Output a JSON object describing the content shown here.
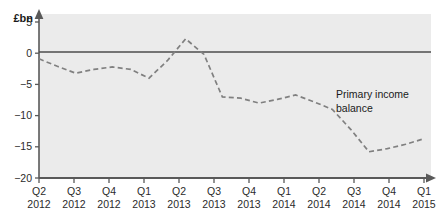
{
  "chart_data": {
    "type": "line",
    "title": "",
    "subtitle": "",
    "unit_label": "£bn",
    "xlabel": "",
    "ylabel": "",
    "ylim": [
      -20,
      5
    ],
    "yticks": [
      5,
      0,
      -5,
      -10,
      -15,
      -20
    ],
    "ytick_labels": [
      "5",
      "0",
      "−5",
      "−10",
      "−15",
      "−20"
    ],
    "grid": false,
    "zero_line": true,
    "legend_position": "inline-annotation",
    "categories": [
      "Q2 2012",
      "Q3 2012",
      "Q4 2012",
      "Q1 2013",
      "Q2 2013",
      "Q3 2013",
      "Q4 2013",
      "Q1 2014",
      "Q2 2014",
      "Q3 2014",
      "Q4 2014",
      "Q1 2015"
    ],
    "xtick_labels": [
      {
        "quarter": "Q2",
        "year": "2012"
      },
      {
        "quarter": "Q3",
        "year": "2012"
      },
      {
        "quarter": "Q4",
        "year": "2012"
      },
      {
        "quarter": "Q1",
        "year": "2013"
      },
      {
        "quarter": "Q2",
        "year": "2013"
      },
      {
        "quarter": "Q3",
        "year": "2013"
      },
      {
        "quarter": "Q4",
        "year": "2013"
      },
      {
        "quarter": "Q1",
        "year": "2014"
      },
      {
        "quarter": "Q2",
        "year": "2014"
      },
      {
        "quarter": "Q3",
        "year": "2014"
      },
      {
        "quarter": "Q4",
        "year": "2014"
      },
      {
        "quarter": "Q1",
        "year": "2015"
      }
    ],
    "series": [
      {
        "name": "Primary income balance",
        "annotation": "Primary income balance",
        "annotation_lines": [
          "Primary income",
          "balance"
        ],
        "style": "dashed",
        "color": "#808080",
        "x": [
          "Q2 2012",
          "2012-H2a",
          "Q3 2012",
          "2012-H2b",
          "Q4 2012",
          "2012-H2c",
          "Q1 2013",
          "2013-Q1b",
          "Q2 2013",
          "2013-Q2b",
          "Q3 2013",
          "2013-Q3b",
          "Q4 2013",
          "2013-Q4b",
          "Q1 2014",
          "2014-Q1b",
          "Q2 2014",
          "2014-Q2b",
          "Q3 2014",
          "2014-Q3b",
          "Q4 2014",
          "Q1 2015"
        ],
        "values": [
          -0.9,
          -2.1,
          -3.2,
          -2.6,
          -2.2,
          -2.6,
          -4.0,
          -1.2,
          2.3,
          -0.2,
          -7.0,
          -7.2,
          -8.0,
          -7.4,
          -6.7,
          -7.8,
          -9.0,
          -12.2,
          -15.8,
          -15.3,
          -14.6,
          -13.7
        ],
        "key_points": [
          {
            "label": "Q2 2012",
            "value": -0.9
          },
          {
            "label": "Q3 2012",
            "value": -3.2
          },
          {
            "label": "Q4 2012",
            "value": -2.2
          },
          {
            "label": "Q1 2013",
            "value": -4.0
          },
          {
            "label": "Q2 2013",
            "value": 2.3
          },
          {
            "label": "Q3 2013",
            "value": -7.0
          },
          {
            "label": "Q4 2013",
            "value": -8.0
          },
          {
            "label": "Q1 2014",
            "value": -6.7
          },
          {
            "label": "Q2 2014",
            "value": -9.0
          },
          {
            "label": "Q3 2014",
            "value": -15.8
          },
          {
            "label": "Q4 2014",
            "value": -14.6
          },
          {
            "label": "Q1 2015",
            "value": -13.7
          }
        ]
      }
    ],
    "colors": {
      "plot_background": "#ebebeb",
      "page_background": "#ffffff",
      "axis": "#595959",
      "zero_line": "#4d4d4d",
      "series_line": "#808080",
      "text": "#1a1a1a"
    }
  }
}
